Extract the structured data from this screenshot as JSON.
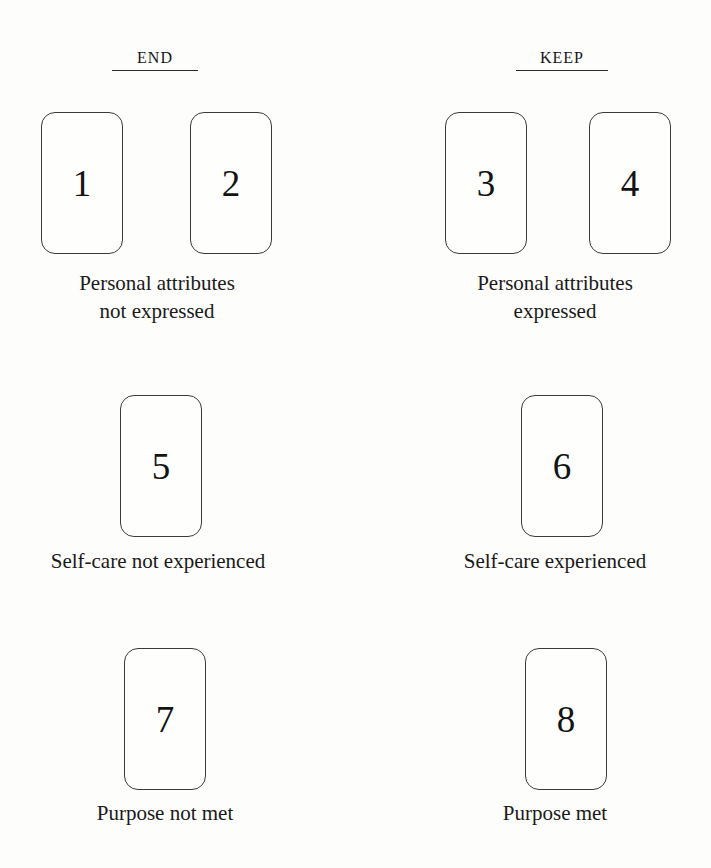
{
  "figure": {
    "columns": [
      {
        "id": "end",
        "label": "End"
      },
      {
        "id": "keep",
        "label": "Keep"
      }
    ],
    "cards": [
      {
        "number": "1"
      },
      {
        "number": "2"
      },
      {
        "number": "3"
      },
      {
        "number": "4"
      },
      {
        "number": "5"
      },
      {
        "number": "6"
      },
      {
        "number": "7"
      },
      {
        "number": "8"
      }
    ],
    "captions": [
      {
        "line1": "Personal attributes",
        "line2": "not expressed"
      },
      {
        "line1": "Personal attributes",
        "line2": "expressed"
      },
      {
        "line1": "Self-care not experienced",
        "line2": ""
      },
      {
        "line1": "Self-care experienced",
        "line2": ""
      },
      {
        "line1": "Purpose not met",
        "line2": ""
      },
      {
        "line1": "Purpose met",
        "line2": ""
      }
    ]
  }
}
